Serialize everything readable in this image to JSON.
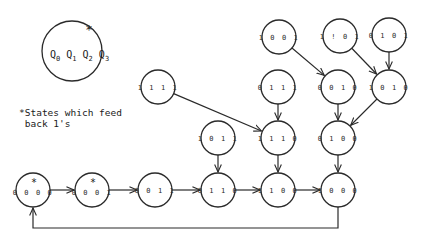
{
  "legend": {
    "star": "*",
    "variables": [
      {
        "name": "Q",
        "sub": "0"
      },
      {
        "name": "Q",
        "sub": "1"
      },
      {
        "name": "Q",
        "sub": "2"
      },
      {
        "name": "Q",
        "sub": "3"
      }
    ]
  },
  "note": {
    "line1": "*States which feed",
    "line2": " back 1's"
  },
  "nodes": [
    {
      "id": "0000",
      "label": "0 0 0 0",
      "x": 33,
      "y": 190,
      "star": true
    },
    {
      "id": "0001",
      "label": "0 0 0 1",
      "x": 92,
      "y": 190,
      "star": true
    },
    {
      "id": "0011",
      "label": "0 0 1 1",
      "x": 155,
      "y": 190,
      "star": false
    },
    {
      "id": "0110",
      "label": "0 1 1 0",
      "x": 218,
      "y": 190,
      "star": false
    },
    {
      "id": "1100",
      "label": "1 1 0 0",
      "x": 278,
      "y": 190,
      "star": false
    },
    {
      "id": "1000",
      "label": "1 0 0 0",
      "x": 338,
      "y": 190,
      "star": false
    },
    {
      "id": "1011",
      "label": "1 0 1 1",
      "x": 218,
      "y": 138,
      "star": false
    },
    {
      "id": "1110",
      "label": "1 1 1 0",
      "x": 278,
      "y": 138,
      "star": false
    },
    {
      "id": "0100",
      "label": "0 1 0 0",
      "x": 338,
      "y": 138,
      "star": false
    },
    {
      "id": "1111",
      "label": "1 1 1 1",
      "x": 158,
      "y": 87,
      "star": false
    },
    {
      "id": "0111",
      "label": "0 1 1 1",
      "x": 278,
      "y": 87,
      "star": false
    },
    {
      "id": "0010",
      "label": "0 0 1 0",
      "x": 338,
      "y": 87,
      "star": false
    },
    {
      "id": "1010",
      "label": "1 0 1 0",
      "x": 389,
      "y": 87,
      "star": false
    },
    {
      "id": "1001",
      "label": "1 0 0 1",
      "x": 279,
      "y": 37,
      "star": false
    },
    {
      "id": "1!01",
      "label": "1 ! 0 1",
      "x": 340,
      "y": 36,
      "star": false
    },
    {
      "id": "0101",
      "label": "0 1 0 1",
      "x": 389,
      "y": 35,
      "star": false
    }
  ],
  "edges": [
    {
      "from": "0000",
      "to": "0001"
    },
    {
      "from": "0001",
      "to": "0011"
    },
    {
      "from": "0011",
      "to": "0110"
    },
    {
      "from": "0110",
      "to": "1100"
    },
    {
      "from": "1100",
      "to": "1000"
    },
    {
      "from": "1000",
      "to": "0000",
      "route": "loop-bottom"
    },
    {
      "from": "1011",
      "to": "0110"
    },
    {
      "from": "1110",
      "to": "1100"
    },
    {
      "from": "0100",
      "to": "1000"
    },
    {
      "from": "1111",
      "to": "1110"
    },
    {
      "from": "0111",
      "to": "1110"
    },
    {
      "from": "0010",
      "to": "0100"
    },
    {
      "from": "1010",
      "to": "0100"
    },
    {
      "from": "1001",
      "to": "0010"
    },
    {
      "from": "1!01",
      "to": "1010"
    },
    {
      "from": "0101",
      "to": "1010"
    }
  ]
}
